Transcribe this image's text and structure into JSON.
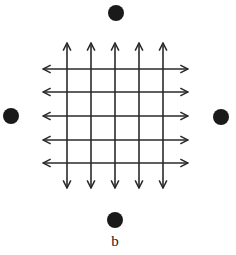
{
  "figure": {
    "label": "b",
    "colors": {
      "line": "#2a2a2a",
      "dot": "#1a1a1a",
      "background": "#ffffff"
    },
    "grid": {
      "vertical_arrows_x": [
        67,
        91,
        115,
        139,
        163
      ],
      "vertical_span": [
        43,
        188
      ],
      "horizontal_arrows_y": [
        69,
        92,
        116,
        140,
        163
      ],
      "horizontal_span": [
        43,
        188
      ],
      "arrow_style": "double-headed"
    },
    "dots": [
      {
        "name": "top",
        "cx": 116,
        "cy": 13,
        "r": 8
      },
      {
        "name": "left",
        "cx": 11,
        "cy": 116,
        "r": 8
      },
      {
        "name": "right",
        "cx": 221,
        "cy": 117,
        "r": 8
      },
      {
        "name": "bottom",
        "cx": 115,
        "cy": 220,
        "r": 8
      }
    ]
  }
}
